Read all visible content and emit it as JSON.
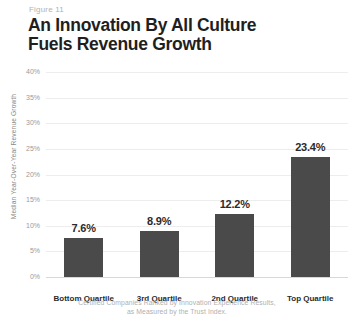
{
  "figure": {
    "number": "Figure 11",
    "title_line1": "An Innovation By All Culture",
    "title_line2": "Fuels Revenue Growth",
    "caption_line1": "Certified Companies Ranked by Innovation Experience Results,",
    "caption_line2": "as Measured by the Trust Index."
  },
  "colors": {
    "bar": "#4a4a4a",
    "title": "#1f1f1f",
    "axis_text": "#9a9a9a",
    "caption": "#b0b0b0",
    "gridline": "#ededed"
  },
  "chart_data": {
    "type": "bar",
    "title": "An Innovation By All Culture Fuels Revenue Growth",
    "subtitle": "Figure 11",
    "categories": [
      "Bottom Quartile",
      "3rd Quartile",
      "2nd Quartile",
      "Top Quartile"
    ],
    "values": [
      7.6,
      8.9,
      12.2,
      23.4
    ],
    "value_labels": [
      "7.6%",
      "8.9%",
      "12.2%",
      "23.4%"
    ],
    "xlabel": "",
    "ylabel": "Median Year-Over-Year Revenue Growth",
    "ylim": [
      0,
      40
    ],
    "ytick_values": [
      0,
      5,
      10,
      15,
      20,
      25,
      30,
      35,
      40
    ],
    "ytick_labels": [
      "0%",
      "5%",
      "10%",
      "15%",
      "20%",
      "25%",
      "30%",
      "35%",
      "40%"
    ],
    "grid": true,
    "legend": false,
    "annotation": "Certified Companies Ranked by Innovation Experience Results, as Measured by the Trust Index."
  }
}
